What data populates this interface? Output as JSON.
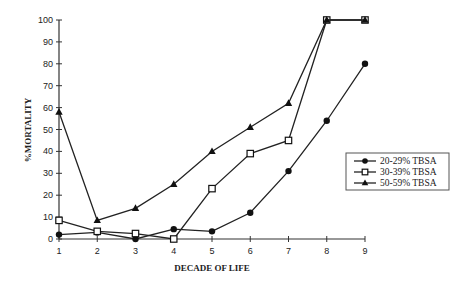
{
  "chart_data": {
    "type": "line",
    "title": "",
    "xlabel": "DECADE OF LIFE",
    "ylabel": "%MORTALITY",
    "x": [
      1,
      2,
      3,
      4,
      5,
      6,
      7,
      8,
      9
    ],
    "xlim": [
      1,
      9
    ],
    "ylim": [
      0,
      100
    ],
    "yticks": [
      0,
      10,
      20,
      30,
      40,
      50,
      60,
      70,
      80,
      90,
      100
    ],
    "grid": false,
    "legend_position": "right",
    "series": [
      {
        "name": "20-29% TBSA",
        "marker": "circle",
        "x": [
          1,
          2,
          3,
          4,
          5,
          6,
          7,
          8,
          9
        ],
        "values": [
          2,
          3,
          0,
          4.5,
          3.5,
          12,
          31,
          54,
          80
        ]
      },
      {
        "name": "30-39% TBSA",
        "marker": "square",
        "x": [
          1,
          2,
          3,
          4,
          5,
          6,
          7,
          8,
          9
        ],
        "values": [
          8.5,
          3.5,
          2.5,
          0,
          23,
          39,
          45,
          100,
          100
        ]
      },
      {
        "name": "50-59% TBSA",
        "marker": "triangle",
        "x": [
          1,
          2,
          3,
          4,
          5,
          6,
          7,
          8,
          9
        ],
        "values": [
          58,
          8.5,
          14,
          25,
          40,
          51,
          62,
          100,
          100
        ]
      }
    ]
  },
  "layout": {
    "plot": {
      "x0": 59,
      "x1": 365,
      "y0": 239,
      "y1": 20
    },
    "legend": {
      "x": 346,
      "y": 153,
      "w": 103,
      "h": 37
    },
    "colors": {
      "line": "#222222",
      "axis": "#333333",
      "legend_border": "#555555"
    }
  }
}
